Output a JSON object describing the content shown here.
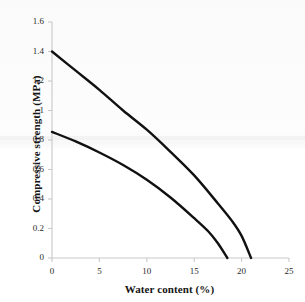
{
  "chart_data": {
    "type": "line",
    "title": "",
    "xlabel": "Water content (%)",
    "ylabel": "Compressive strength (MPa)",
    "xlim": [
      0,
      25
    ],
    "ylim": [
      0,
      1.6
    ],
    "xticks": [
      "0",
      "5",
      "10",
      "15",
      "20",
      "25"
    ],
    "yticks": [
      "0",
      "0.2",
      "0.4",
      "0.6",
      "0.8",
      "1",
      "1.2",
      "1.4",
      "1.6"
    ],
    "grid": false,
    "legend": "none",
    "line_color": "#111111",
    "axis_color": "#c9c9c9",
    "background": "#ffffff",
    "series": [
      {
        "name": "upper-curve",
        "x": [
          0,
          2.5,
          5,
          7.5,
          10,
          12.5,
          15,
          17.5,
          19,
          20,
          21
        ],
        "y": [
          1.4,
          1.27,
          1.14,
          1.0,
          0.87,
          0.72,
          0.56,
          0.37,
          0.25,
          0.15,
          0.0
        ]
      },
      {
        "name": "lower-curve",
        "x": [
          0,
          2.5,
          5,
          7.5,
          10,
          12.5,
          15,
          16.5,
          17.5,
          18.5
        ],
        "y": [
          0.855,
          0.79,
          0.715,
          0.63,
          0.53,
          0.41,
          0.27,
          0.18,
          0.1,
          0.0
        ]
      }
    ]
  },
  "axis_labels": {
    "x_title": "Water content (%)",
    "y_title": "Compressive strength (MPa)",
    "y": [
      "1.6",
      "1.4",
      "1.2",
      "1",
      "0.8",
      "0.6",
      "0.4",
      "0.2",
      "0"
    ],
    "x": [
      "0",
      "5",
      "10",
      "15",
      "20",
      "25"
    ]
  }
}
